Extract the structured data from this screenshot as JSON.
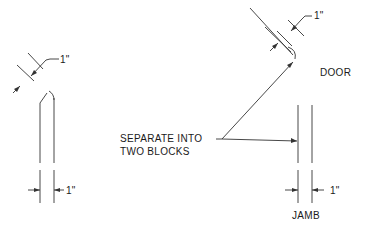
{
  "diagram": {
    "callout": {
      "line1": "SEPARATE INTO",
      "line2": "TWO BLOCKS"
    },
    "left_figure": {
      "top_dimension": "1\"",
      "bottom_dimension": "1\""
    },
    "right_figure": {
      "door_label": "DOOR",
      "door_dimension": "1\"",
      "jamb_label": "JAMB",
      "jamb_dimension": "1\""
    },
    "colors": {
      "line": "#333333",
      "background": "#ffffff"
    }
  }
}
